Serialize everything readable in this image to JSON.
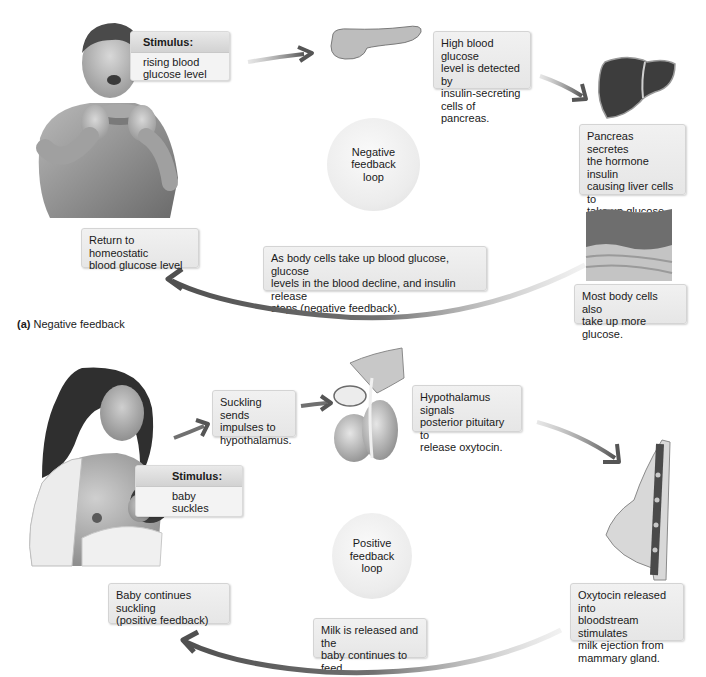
{
  "panel_a": {
    "caption_letter": "(a)",
    "caption_text": "Negative feedback",
    "stimulus": {
      "heading": "Stimulus:",
      "line1": "rising blood",
      "line2": "glucose level"
    },
    "loop_label": {
      "line1": "Negative",
      "line2": "feedback",
      "line3": "loop"
    },
    "steps": [
      {
        "lines": [
          "High blood glucose",
          "level is detected by",
          "insulin-secreting",
          "cells of pancreas."
        ]
      },
      {
        "lines": [
          "Pancreas secretes",
          "the hormone insulin",
          "causing liver cells to",
          "take up glucose and",
          "store it as glycogen."
        ]
      },
      {
        "lines": [
          "Most body cells also",
          "take up more glucose."
        ]
      },
      {
        "lines": [
          "As body cells take up blood glucose, glucose",
          "levels in the blood decline, and insulin release",
          "stops (negative feedback)."
        ]
      },
      {
        "lines": [
          "Return to homeostatic",
          "blood glucose level"
        ]
      }
    ],
    "illustrations": [
      "person-eating",
      "pancreas",
      "liver",
      "body-tissue"
    ]
  },
  "panel_b": {
    "stimulus": {
      "heading": "Stimulus:",
      "line1": "baby suckles",
      "line2": "at nipple"
    },
    "loop_label": {
      "line1": "Positive",
      "line2": "feedback",
      "line3": "loop"
    },
    "steps": [
      {
        "lines": [
          "Suckling sends",
          "impulses to",
          "hypothalamus."
        ]
      },
      {
        "lines": [
          "Hypothalamus signals",
          "posterior pituitary to",
          "release oxytocin."
        ]
      },
      {
        "lines": [
          "Oxytocin released into",
          "bloodstream stimulates",
          "milk ejection from",
          "mammary gland."
        ]
      },
      {
        "lines": [
          "Milk is released and the",
          "baby continues to feed."
        ]
      },
      {
        "lines": [
          "Baby continues suckling",
          "(positive feedback)"
        ]
      }
    ],
    "illustrations": [
      "mother-nursing-baby",
      "hypothalamus-pituitary",
      "mammary-gland"
    ]
  },
  "colors": {
    "box_bg": "#ececec",
    "arrow": "#5a5a5a",
    "loop_bg": "#ececec",
    "text": "#1a1a1a"
  }
}
